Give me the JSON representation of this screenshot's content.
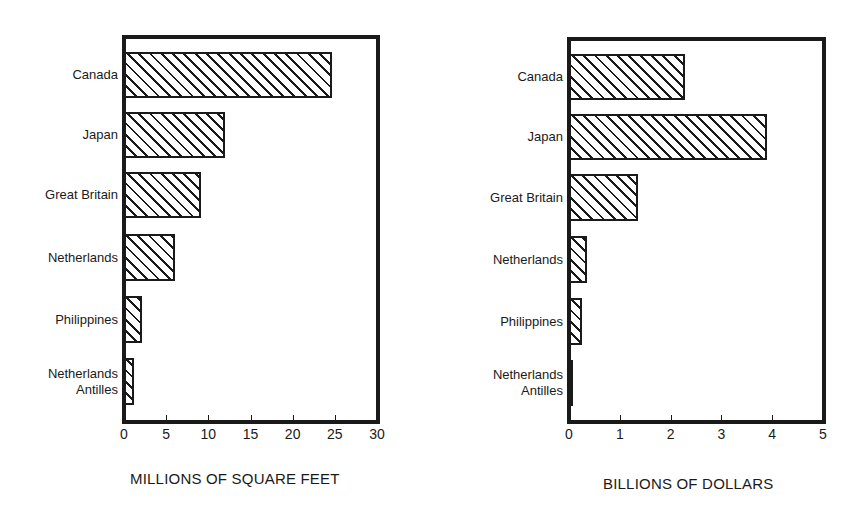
{
  "chart_data": [
    {
      "type": "bar",
      "orientation": "horizontal",
      "title": "",
      "xlabel": "MILLIONS OF SQUARE FEET",
      "ylabel": "",
      "categories": [
        "Canada",
        "Japan",
        "Great Britain",
        "Netherlands",
        "Philippines",
        "Netherlands\nAntilles"
      ],
      "values": [
        24.7,
        12.0,
        9.1,
        6.0,
        2.1,
        1.2
      ],
      "xlim": [
        0,
        30
      ],
      "xticks": [
        "0",
        "5",
        "10",
        "15",
        "20",
        "25",
        "30"
      ],
      "grid": false,
      "legend": null,
      "bar_fill": "diagonal-hatch"
    },
    {
      "type": "bar",
      "orientation": "horizontal",
      "title": "",
      "xlabel": "BILLIONS OF DOLLARS",
      "ylabel": "",
      "categories": [
        "Canada",
        "Japan",
        "Great Britain",
        "Netherlands",
        "Philippines",
        "Netherlands\nAntilles"
      ],
      "values": [
        2.28,
        3.9,
        1.36,
        0.35,
        0.25,
        0.05
      ],
      "xlim": [
        0,
        5
      ],
      "xticks": [
        "0",
        "1",
        "2",
        "3",
        "4",
        "5"
      ],
      "grid": false,
      "legend": null,
      "bar_fill": "diagonal-hatch"
    }
  ]
}
